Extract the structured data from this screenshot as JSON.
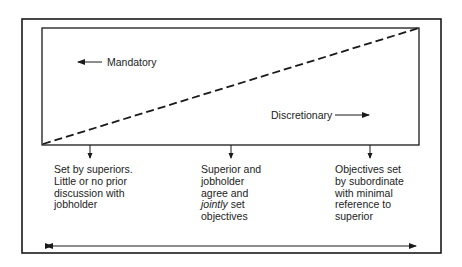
{
  "diagram": {
    "type": "continuum",
    "labels": {
      "mandatory": "Mandatory",
      "discretionary": "Discretionary"
    },
    "stages": [
      {
        "id": "left",
        "lines": [
          "Set by superiors.",
          "Little or no prior",
          "discussion with",
          "jobholder"
        ]
      },
      {
        "id": "middle",
        "lines": [
          "Superior and",
          "jobholder",
          "agree and",
          "set",
          "objectives"
        ],
        "emphasis_word": "jointly"
      },
      {
        "id": "right",
        "lines": [
          "Objectives set",
          "by subordinate",
          "with minimal",
          "reference to",
          "superior"
        ]
      }
    ],
    "colors": {
      "line": "#1a1a1a",
      "background": "#ffffff"
    }
  }
}
